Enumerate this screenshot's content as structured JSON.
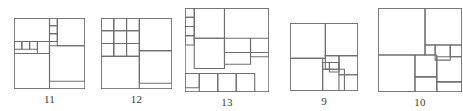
{
  "page": {
    "background_color": "#ffffff",
    "line_color": "#6e6e6e",
    "label_color": "#3a3a3a"
  },
  "figures": [
    {
      "label": "11",
      "name": "squared-square-order-11",
      "order": 11,
      "box": {
        "x": 14,
        "y": 18,
        "w": 71,
        "h": 71
      },
      "side": 100,
      "squares": [
        {
          "x": 0,
          "y": 0,
          "s": 50
        },
        {
          "x": 50,
          "y": 0,
          "s": 11
        },
        {
          "x": 61,
          "y": 0,
          "s": 39
        },
        {
          "x": 50,
          "y": 11,
          "s": 11
        },
        {
          "x": 50,
          "y": 22,
          "s": 11
        },
        {
          "x": 0,
          "y": 33,
          "s": 11
        },
        {
          "x": 11,
          "y": 33,
          "s": 11
        },
        {
          "x": 22,
          "y": 33,
          "s": 11
        },
        {
          "x": 33,
          "y": 33,
          "s": 17
        },
        {
          "x": 0,
          "y": 50,
          "s": 50
        },
        {
          "x": 50,
          "y": 39,
          "s": 50
        }
      ]
    },
    {
      "label": "12",
      "name": "squared-square-order-12",
      "order": 12,
      "box": {
        "x": 101,
        "y": 18,
        "w": 71,
        "h": 71
      },
      "side": 100,
      "squares": [
        {
          "x": 0,
          "y": 0,
          "s": 18
        },
        {
          "x": 18,
          "y": 0,
          "s": 18
        },
        {
          "x": 36,
          "y": 0,
          "s": 18
        },
        {
          "x": 54,
          "y": 0,
          "s": 46
        },
        {
          "x": 0,
          "y": 18,
          "s": 18
        },
        {
          "x": 18,
          "y": 18,
          "s": 18
        },
        {
          "x": 36,
          "y": 18,
          "s": 18
        },
        {
          "x": 0,
          "y": 36,
          "s": 18
        },
        {
          "x": 18,
          "y": 36,
          "s": 18
        },
        {
          "x": 36,
          "y": 36,
          "s": 18
        },
        {
          "x": 0,
          "y": 54,
          "s": 54
        },
        {
          "x": 54,
          "y": 46,
          "s": 46
        }
      ]
    },
    {
      "label": "13",
      "name": "squared-square-order-13",
      "order": 13,
      "box": {
        "x": 185,
        "y": 8,
        "w": 84,
        "h": 84
      },
      "side": 100,
      "squares": [
        {
          "x": 0,
          "y": 0,
          "s": 11
        },
        {
          "x": 11,
          "y": 0,
          "s": 36
        },
        {
          "x": 47,
          "y": 0,
          "s": 53
        },
        {
          "x": 0,
          "y": 11,
          "s": 11
        },
        {
          "x": 0,
          "y": 22,
          "s": 11
        },
        {
          "x": 11,
          "y": 36,
          "s": 36
        },
        {
          "x": 47,
          "y": 36,
          "s": 31
        },
        {
          "x": 78,
          "y": 36,
          "s": 22
        },
        {
          "x": 0,
          "y": 33,
          "s": 11
        },
        {
          "x": 0,
          "y": 78,
          "s": 17
        },
        {
          "x": 17,
          "y": 78,
          "s": 22
        },
        {
          "x": 39,
          "y": 78,
          "s": 22
        },
        {
          "x": 61,
          "y": 78,
          "s": 22
        }
      ]
    },
    {
      "label": "9",
      "name": "squared-square-order-9",
      "order": 9,
      "box": {
        "x": 290,
        "y": 23,
        "w": 68,
        "h": 68
      },
      "side": 100,
      "squares": [
        {
          "x": 0,
          "y": 0,
          "s": 52
        },
        {
          "x": 52,
          "y": 0,
          "s": 48
        },
        {
          "x": 52,
          "y": 48,
          "s": 20
        },
        {
          "x": 72,
          "y": 48,
          "s": 28
        },
        {
          "x": 0,
          "y": 52,
          "s": 48
        },
        {
          "x": 48,
          "y": 58,
          "s": 10
        },
        {
          "x": 58,
          "y": 58,
          "s": 14
        },
        {
          "x": 48,
          "y": 68,
          "s": 32
        },
        {
          "x": 72,
          "y": 76,
          "s": 28
        }
      ]
    },
    {
      "label": "10",
      "name": "squared-square-order-10",
      "order": 10,
      "box": {
        "x": 378,
        "y": 8,
        "w": 84,
        "h": 84
      },
      "side": 100,
      "squares": [
        {
          "x": 0,
          "y": 0,
          "s": 56
        },
        {
          "x": 56,
          "y": 0,
          "s": 44
        },
        {
          "x": 56,
          "y": 44,
          "s": 12
        },
        {
          "x": 68,
          "y": 44,
          "s": 18
        },
        {
          "x": 86,
          "y": 44,
          "s": 14
        },
        {
          "x": 0,
          "y": 56,
          "s": 44
        },
        {
          "x": 44,
          "y": 56,
          "s": 26
        },
        {
          "x": 70,
          "y": 58,
          "s": 30
        },
        {
          "x": 44,
          "y": 82,
          "s": 26
        },
        {
          "x": 70,
          "y": 88,
          "s": 30
        }
      ]
    }
  ]
}
